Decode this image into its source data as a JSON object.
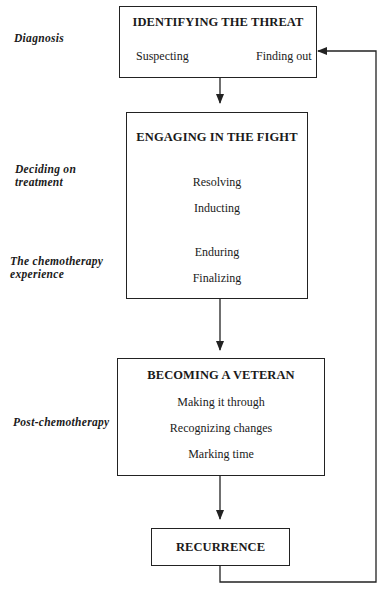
{
  "phases": [
    {
      "label": "Diagnosis"
    },
    {
      "label_line1": "Deciding on",
      "label_line2": "treatment"
    },
    {
      "label_line1": "The chemotherapy",
      "label_line2": "experience"
    },
    {
      "label": "Post-chemotherapy"
    }
  ],
  "stages": [
    {
      "title": "IDENTIFYING THE THREAT",
      "items": [
        "Suspecting",
        "Finding out"
      ]
    },
    {
      "title": "ENGAGING IN THE FIGHT",
      "items": [
        "Resolving",
        "Inducting",
        "Enduring",
        "Finalizing"
      ]
    },
    {
      "title": "BECOMING A VETERAN",
      "items": [
        "Making it through",
        "Recognizing changes",
        "Marking time"
      ]
    },
    {
      "title": "RECURRENCE",
      "items": []
    }
  ],
  "edges": [
    {
      "from": "Suspecting",
      "to": "Finding out"
    },
    {
      "from": "IDENTIFYING THE THREAT",
      "to": "ENGAGING IN THE FIGHT"
    },
    {
      "from": "ENGAGING IN THE FIGHT",
      "to": "BECOMING A VETERAN"
    },
    {
      "from": "BECOMING A VETERAN",
      "to": "RECURRENCE"
    },
    {
      "from": "RECURRENCE",
      "to": "Finding out"
    }
  ]
}
